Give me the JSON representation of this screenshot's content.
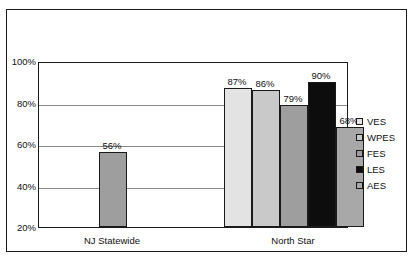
{
  "chart_data": {
    "type": "bar",
    "title": "",
    "xlabel": "",
    "ylabel": "",
    "ylim": [
      20,
      100
    ],
    "grid": true,
    "legend_position": "right",
    "ytick_labels": [
      "100%",
      "80%",
      "60%",
      "40%",
      "20%"
    ],
    "ytick_values": [
      100,
      80,
      60,
      40,
      20
    ],
    "categories": [
      "NJ Statewide",
      "North Star"
    ],
    "series": [
      {
        "name": "VES",
        "color": "#e3e3e3",
        "values": [
          null,
          87
        ],
        "labels": [
          null,
          "87%"
        ]
      },
      {
        "name": "WPES",
        "color": "#c9c9c9",
        "values": [
          null,
          86
        ],
        "labels": [
          null,
          "86%"
        ]
      },
      {
        "name": "FES",
        "color": "#9e9e9e",
        "values": [
          56,
          79
        ],
        "labels": [
          "56%",
          "79%"
        ]
      },
      {
        "name": "LES",
        "color": "#0d0d0d",
        "values": [
          null,
          90
        ],
        "labels": [
          null,
          "90%"
        ]
      },
      {
        "name": "AES",
        "color": "#a8a8a8",
        "values": [
          null,
          68
        ],
        "labels": [
          null,
          "68%"
        ]
      }
    ],
    "plotted_bars": [
      {
        "group": "NJ Statewide",
        "series": "FES",
        "value": 56,
        "label": "56%",
        "color": "#9e9e9e"
      },
      {
        "group": "North Star",
        "series": "VES",
        "value": 87,
        "label": "87%",
        "color": "#e3e3e3"
      },
      {
        "group": "North Star",
        "series": "WPES",
        "value": 86,
        "label": "86%",
        "color": "#c9c9c9"
      },
      {
        "group": "North Star",
        "series": "FES",
        "value": 79,
        "label": "79%",
        "color": "#9e9e9e"
      },
      {
        "group": "North Star",
        "series": "LES",
        "value": 90,
        "label": "90%",
        "color": "#0d0d0d"
      },
      {
        "group": "North Star",
        "series": "AES",
        "value": 68,
        "label": "68%",
        "color": "#a8a8a8"
      }
    ]
  },
  "legend": {
    "items": [
      {
        "label": "VES",
        "color": "#e3e3e3"
      },
      {
        "label": "WPES",
        "color": "#c9c9c9"
      },
      {
        "label": "FES",
        "color": "#9e9e9e"
      },
      {
        "label": "LES",
        "color": "#0d0d0d"
      },
      {
        "label": "AES",
        "color": "#a8a8a8"
      }
    ]
  },
  "axis": {
    "y_ticks": [
      "100%",
      "80%",
      "60%",
      "40%",
      "20%"
    ],
    "x_categories": [
      "NJ Statewide",
      "North Star"
    ]
  },
  "colors": {
    "frame": "#1a1a1a",
    "gridline": "#8a8a8a",
    "background": "#ffffff",
    "text": "#111111"
  }
}
